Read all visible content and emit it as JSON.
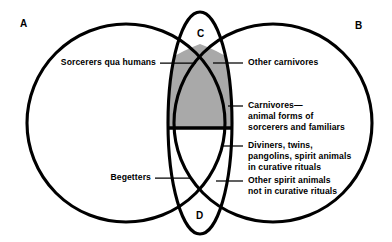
{
  "figure": {
    "type": "venn-diagram",
    "regions": [
      {
        "id": "A",
        "letter": "A"
      },
      {
        "id": "B",
        "letter": "B"
      },
      {
        "id": "C",
        "letter": "C"
      },
      {
        "id": "D",
        "letter": "D"
      }
    ],
    "colors": {
      "stroke": "#000000",
      "background": "#ffffff",
      "shaded_region": "#a9a9a9"
    },
    "callouts": {
      "sorcerers_qua_humans": {
        "lines": [
          "Sorcerers qua humans"
        ]
      },
      "begetters": {
        "lines": [
          "Begetters"
        ]
      },
      "other_carnivores": {
        "lines": [
          "Other carnivores"
        ]
      },
      "carnivores_animal_forms": {
        "lines": [
          "Carnivores—",
          "animal forms of",
          "sorcerers and familiars"
        ]
      },
      "diviners_twins": {
        "lines": [
          "Diviners, twins,",
          "pangolins, spirit animals",
          "in curative rituals"
        ]
      },
      "other_spirit_animals": {
        "lines": [
          "Other spirit animals",
          "not in curative rituals"
        ]
      }
    }
  }
}
